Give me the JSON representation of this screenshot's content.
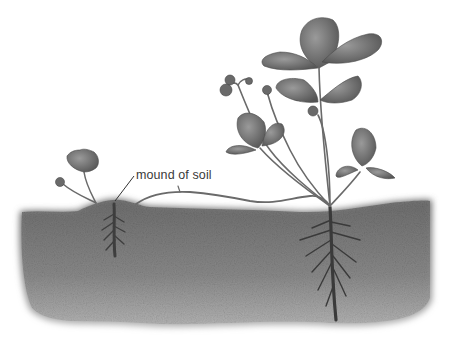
{
  "figure": {
    "labels": [
      {
        "id": "mound",
        "text": "mound of soil",
        "x": 136,
        "y": 168
      }
    ],
    "colors": {
      "background": "#ffffff",
      "soil": "#7a7a7a",
      "soil_dark": "#4a4a4a",
      "leaf": "#6e6e6e",
      "leaf_dark": "#4f4f4f",
      "stem": "#6a6a6a",
      "label_text": "#3a3a3a"
    }
  }
}
